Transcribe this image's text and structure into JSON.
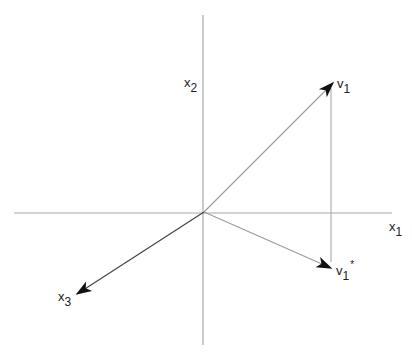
{
  "diagram": {
    "type": "vector-projection",
    "origin": [
      204,
      212
    ],
    "axes": [
      {
        "name": "x1",
        "base": "x",
        "sub": "1",
        "from": [
          14,
          213
        ],
        "to": [
          392,
          213
        ]
      },
      {
        "name": "x2",
        "base": "x",
        "sub": "2",
        "from": [
          203,
          15
        ],
        "to": [
          203,
          345
        ]
      },
      {
        "name": "x3",
        "base": "x",
        "sub": "3",
        "from": [
          204,
          212
        ],
        "to": [
          77,
          294
        ]
      }
    ],
    "vectors": [
      {
        "name": "v1",
        "base": "v",
        "sub": "1",
        "sup": "",
        "from": [
          204,
          212
        ],
        "to": [
          333,
          83
        ]
      },
      {
        "name": "v1*",
        "base": "v",
        "sub": "1",
        "sup": "*",
        "from": [
          204,
          212
        ],
        "to": [
          331,
          268
        ]
      }
    ],
    "projection_line": {
      "from": [
        331,
        88
      ],
      "to": [
        331,
        262
      ]
    },
    "colors": {
      "axis": "#a8a8a8",
      "vector": "#9a9a9a",
      "x3_axis": "#444444",
      "projection": "#b0b0b0",
      "arrowhead": "#111111",
      "label": "#222222"
    }
  },
  "labels": {
    "x1": {
      "base": "x",
      "sub": "1"
    },
    "x2": {
      "base": "x",
      "sub": "2"
    },
    "x3": {
      "base": "x",
      "sub": "3"
    },
    "v1": {
      "base": "v",
      "sub": "1"
    },
    "v1_star": {
      "base": "v",
      "sub": "1",
      "sup": "*"
    }
  }
}
